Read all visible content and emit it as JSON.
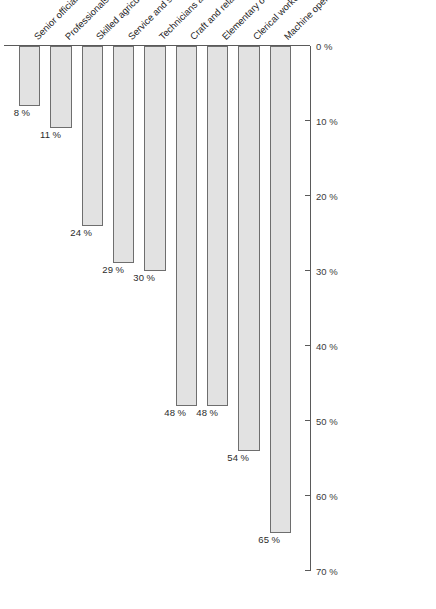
{
  "chart_data": {
    "type": "bar",
    "orientation": "vertical-rotated",
    "title": "",
    "subtitle": "",
    "xlabel": "",
    "ylabel": "",
    "ylim": [
      0,
      70
    ],
    "grid": false,
    "legend": false,
    "value_suffix": " %",
    "categories": [
      "Senior officials and managers",
      "Professionals",
      "Skilled agricultural and fishery workers",
      "Service and sales workers",
      "Technicians and associate professionals",
      "Craft and related trades workers",
      "Elementary occupations",
      "Clerical workers",
      "Machine operators and assemblers"
    ],
    "values": [
      8,
      11,
      24,
      29,
      30,
      48,
      48,
      54,
      65
    ],
    "value_labels": [
      "8 %",
      "11 %",
      "24 %",
      "29 %",
      "30 %",
      "48 %",
      "48 %",
      "54 %",
      "65 %"
    ],
    "axis_ticks": [
      0,
      10,
      20,
      30,
      40,
      50,
      60,
      70
    ],
    "axis_tick_labels": [
      "0 %",
      "10 %",
      "20 %",
      "30 %",
      "40 %",
      "50 %",
      "60 %",
      "70 %"
    ],
    "colors": {
      "bar_fill": "#e2e2e2",
      "bar_border": "#6e6e6e",
      "axis": "#5a5a5a",
      "text": "#1f1f1f",
      "background": "#ffffff"
    }
  }
}
